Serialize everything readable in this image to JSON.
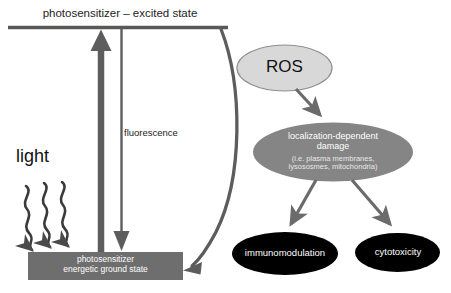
{
  "diagram": {
    "colors": {
      "dark_gray_line": "#595959",
      "ground_state_fill": "#6e6e6e",
      "ros_fill": "#d8d8d8",
      "ros_stroke": "#8a8a8a",
      "localization_fill": "#858585",
      "outcome_fill": "#000000",
      "arrow_gray": "#6b6b6b",
      "text_dark": "#1c1c1c",
      "text_light": "#ffffff",
      "background": "#ffffff"
    },
    "states": {
      "excited_state": "photosensitizer – excited state",
      "ground_state_line1": "photosensitizer",
      "ground_state_line2": "energetic ground state",
      "ground_state_text": "photosensitizer\nenergetic ground state"
    },
    "processes": {
      "light": "light",
      "fluorescence": "fluorescence"
    },
    "nodes": {
      "ros": "ROS",
      "localization_title_line1": "localization-dependent",
      "localization_title_line2": "damage",
      "localization_title": "localization-dependent\ndamage",
      "localization_detail_line1": "(i.e. plasma membranes,",
      "localization_detail_line2": "lysososmes, mitochondria)",
      "localization_detail": "(i.e. plasma membranes,\nlysososmes, mitochondria)",
      "immunomodulation": "immunomodulation",
      "cytotoxicity": "cytotoxicity"
    },
    "arrows": {
      "excitation_arrow": "light absorption (upward excitation arrow)",
      "fluorescence_arrow": "fluorescence emission (downward arrow)",
      "relaxation_curve": "energy transfer / return to ground state (curved arrow)",
      "light_squiggle_1": "incident photon wave arrow 1",
      "light_squiggle_2": "incident photon wave arrow 2",
      "light_squiggle_3": "incident photon wave arrow 3",
      "ros_to_damage": "ROS to localization-dependent damage",
      "damage_to_immunomodulation": "damage to immunomodulation",
      "damage_to_cytotoxicity": "damage to cytotoxicity"
    }
  }
}
